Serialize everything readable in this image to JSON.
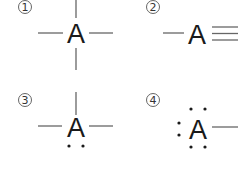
{
  "panels": [
    {
      "number": "1",
      "atom": "A",
      "structure": "four single bonds (up, down, left, right)",
      "bonds": {
        "up": 1,
        "down": 1,
        "left": 1,
        "right": 1
      },
      "lone_pairs": 0
    },
    {
      "number": "2",
      "atom": "A",
      "structure": "single bond left, triple bond right",
      "bonds": {
        "left": 1,
        "right": 3
      },
      "lone_pairs": 0
    },
    {
      "number": "3",
      "atom": "A",
      "structure": "three single bonds (up, left, right), one lone pair below",
      "bonds": {
        "up": 1,
        "left": 1,
        "right": 1
      },
      "lone_pairs": 1,
      "lone_pair_positions": [
        "bottom"
      ]
    },
    {
      "number": "4",
      "atom": "A",
      "structure": "one single bond right, three lone pairs (top, left, bottom)",
      "bonds": {
        "right": 1
      },
      "lone_pairs": 3,
      "lone_pair_positions": [
        "top",
        "left",
        "bottom"
      ]
    }
  ],
  "colors": {
    "bond": "#666666",
    "atom": "#1a1a1a",
    "background": "#ffffff"
  }
}
